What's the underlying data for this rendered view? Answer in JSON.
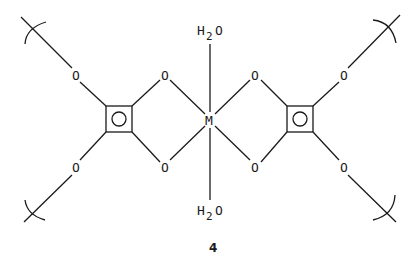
{
  "diagram": {
    "type": "chemical-structure",
    "compound_number": "4",
    "center_atom": "M",
    "axial_ligands": {
      "top": {
        "main": "H",
        "sub": "2",
        "tail": "O"
      },
      "bottom": {
        "main": "H",
        "sub": "2",
        "tail": "O"
      }
    },
    "oxygen_label": "O",
    "rings": [
      {
        "name": "left-squarate-ring",
        "shape": "square-with-circle"
      },
      {
        "name": "right-squarate-ring",
        "shape": "square-with-circle"
      }
    ],
    "chain_continuation": "polymer-bracket",
    "colors": {
      "ink": "#1a1a1a",
      "background": "#ffffff"
    }
  }
}
